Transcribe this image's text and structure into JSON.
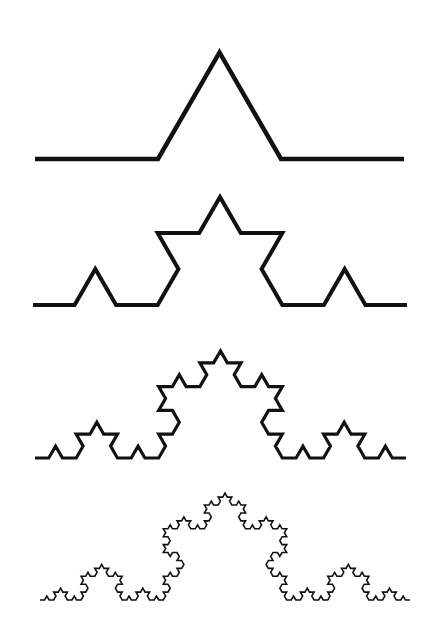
{
  "figure": {
    "background": "#ffffff",
    "stroke_color": "#111111",
    "curves": [
      {
        "iteration": 1,
        "x0": 35,
        "x1": 404,
        "base_y": 159,
        "stroke_width": 4.5
      },
      {
        "iteration": 2,
        "x0": 33,
        "x1": 407,
        "base_y": 305,
        "stroke_width": 4
      },
      {
        "iteration": 3,
        "x0": 35,
        "x1": 406,
        "base_y": 458,
        "stroke_width": 3.2
      },
      {
        "iteration": 4,
        "x0": 40,
        "x1": 410,
        "base_y": 600,
        "stroke_width": 1.6
      }
    ]
  }
}
